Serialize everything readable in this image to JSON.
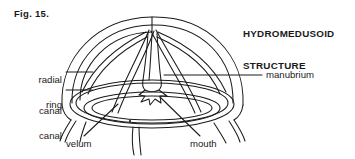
{
  "figure": {
    "caption": "Fig. 15.",
    "title_line1": "HYDROMEDUSOID",
    "title_line2": "STRUCTURE",
    "background_color": "#ffffff",
    "ink_color": "#1a1a1a"
  },
  "labels": {
    "radial_canal": {
      "line1": "radial",
      "line2": "canal"
    },
    "ring_canal": {
      "line1": "ring",
      "line2": "canal"
    },
    "manubrium": {
      "text": "manubrium"
    },
    "velum": {
      "text": "velum"
    },
    "mouth": {
      "text": "mouth"
    }
  },
  "parts": [
    {
      "name": "bell",
      "label": ""
    },
    {
      "name": "radial-canal",
      "label": "radial canal"
    },
    {
      "name": "ring-canal",
      "label": "ring canal"
    },
    {
      "name": "manubrium",
      "label": "manubrium"
    },
    {
      "name": "mouth",
      "label": "mouth"
    },
    {
      "name": "velum",
      "label": "velum"
    },
    {
      "name": "tentacles",
      "label": ""
    }
  ]
}
